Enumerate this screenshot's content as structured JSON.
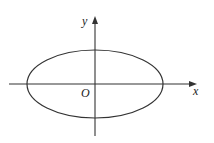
{
  "diagram": {
    "type": "ellipse-on-axes",
    "labels": {
      "x_axis": "x",
      "y_axis": "y",
      "origin": "O"
    },
    "colors": {
      "stroke": "#333333",
      "background": "#ffffff"
    }
  }
}
